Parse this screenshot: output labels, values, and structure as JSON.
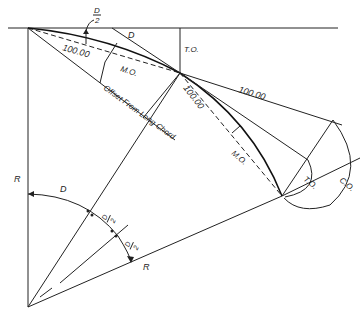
{
  "figure": {
    "type": "geometric-construction",
    "labels": {
      "half_deflection": "D",
      "half_deflection_denominator": "2",
      "deflection_top": "D",
      "tangent_offset_top": "T.O.",
      "chord_length_1": "100.00",
      "chord_length_2": "100.00",
      "tangent_length": "100.00",
      "middle_ordinate_1": "M.O.",
      "middle_ordinate_2": "M.O.",
      "offset_from_long_chord": "Offset From Long Chord",
      "tangent_offset_right": "T.O.",
      "chord_offset": "C.O.",
      "radius_left": "R",
      "radius_bottom": "R",
      "central_angle": "D",
      "half_angle_1_num": "D",
      "half_angle_1_den": "2",
      "half_angle_2_num": "D",
      "half_angle_2_den": "2"
    },
    "colors": {
      "line": "#222222",
      "background": "#ffffff"
    }
  }
}
